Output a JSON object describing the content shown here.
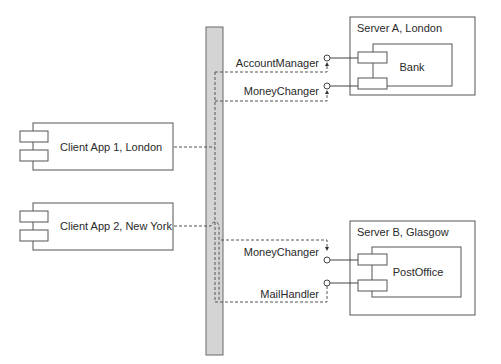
{
  "diagram": {
    "type": "uml-component-deployment",
    "nodes": [
      {
        "id": "server-a",
        "label": "Server A, London",
        "component": {
          "label": "Bank",
          "interfaces": [
            "AccountManager",
            "MoneyChanger"
          ]
        }
      },
      {
        "id": "server-b",
        "label": "Server B, Glasgow",
        "component": {
          "label": "PostOffice",
          "interfaces": [
            "MoneyChanger",
            "MailHandler"
          ]
        }
      }
    ],
    "clients": [
      {
        "id": "client-1",
        "label": "Client App 1, London"
      },
      {
        "id": "client-2",
        "label": "Client App 2, New York"
      }
    ],
    "bus": {
      "label": ""
    },
    "connections": [
      {
        "from": "client-1",
        "to": "bus",
        "style": "dashed"
      },
      {
        "from": "client-2",
        "to": "bus",
        "style": "dashed",
        "hop": true
      },
      {
        "from": "bus",
        "to": "server-a.AccountManager",
        "style": "dashed-dependency"
      },
      {
        "from": "bus",
        "to": "server-a.MoneyChanger",
        "style": "dashed-dependency"
      },
      {
        "from": "bus",
        "to": "server-b.MoneyChanger",
        "style": "dashed-dependency"
      },
      {
        "from": "bus",
        "to": "server-b.MailHandler",
        "style": "dashed-dependency"
      }
    ],
    "colors": {
      "bus_fill": "#d4d4d4",
      "stroke": "#555555",
      "text": "#2a2a2a"
    }
  }
}
